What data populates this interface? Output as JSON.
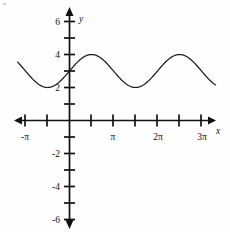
{
  "figure": {
    "name": "sine-curve-graph",
    "background_color": "#fefefe",
    "axis_color": "#111111",
    "curve_color": "#1b1b1b"
  },
  "axes": {
    "x_axis_label": "x",
    "y_axis_label": "y",
    "x_tick_labels": [
      "-π",
      "π",
      "2π",
      "3π"
    ],
    "y_tick_labels": [
      "6",
      "4",
      "2",
      "-2",
      "-4",
      "-6"
    ],
    "x_arrows": "both",
    "y_arrows": "both"
  },
  "chart_data": {
    "type": "line",
    "title": "",
    "xlabel": "x",
    "ylabel": "y",
    "grid": false,
    "legend": "none",
    "equation": "y = 3 + sin(x)",
    "midline": 3,
    "amplitude": 1,
    "period": "2π",
    "xlim": [
      "-1.25π",
      "3.4π"
    ],
    "ylim": [
      -7,
      7
    ],
    "x_tick_values": [
      "-π",
      "-π/2",
      "0",
      "π/2",
      "π",
      "3π/2",
      "2π",
      "5π/2",
      "3π"
    ],
    "x_labeled_ticks": [
      {
        "value": "-π",
        "label": "-π"
      },
      {
        "value": "π",
        "label": "π"
      },
      {
        "value": "2π",
        "label": "2π"
      },
      {
        "value": "3π",
        "label": "3π"
      }
    ],
    "y_tick_values": [
      -6,
      -5,
      -4,
      -3,
      -2,
      -1,
      1,
      2,
      3,
      4,
      5,
      6
    ],
    "y_labeled_ticks": [
      {
        "value": 6,
        "label": "6"
      },
      {
        "value": 4,
        "label": "4"
      },
      {
        "value": 2,
        "label": "2"
      },
      {
        "value": -2,
        "label": "-2"
      },
      {
        "value": -4,
        "label": "-4"
      },
      {
        "value": -6,
        "label": "-6"
      }
    ],
    "key_points": [
      {
        "x": "-π/2",
        "y": 2,
        "kind": "minimum"
      },
      {
        "x": "0",
        "y": 3,
        "kind": "midline-rising"
      },
      {
        "x": "π/2",
        "y": 4,
        "kind": "maximum"
      },
      {
        "x": "π",
        "y": 3,
        "kind": "midline-falling"
      },
      {
        "x": "3π/2",
        "y": 2,
        "kind": "minimum"
      },
      {
        "x": "2π",
        "y": 3,
        "kind": "midline-rising"
      },
      {
        "x": "5π/2",
        "y": 4,
        "kind": "maximum"
      },
      {
        "x": "3π",
        "y": 3,
        "kind": "midline-falling"
      }
    ],
    "series": [
      {
        "name": "y = 3 + sin(x)",
        "x": [
          "-1.15π",
          "-π",
          "-3π/4",
          "-π/2",
          "-π/4",
          "0",
          "π/4",
          "π/2",
          "3π/4",
          "π",
          "5π/4",
          "3π/2",
          "7π/4",
          "2π",
          "9π/4",
          "5π/2",
          "11π/4",
          "3π",
          "13π/4",
          "3.35π"
        ],
        "values": [
          3.45,
          3.0,
          2.29,
          2.0,
          2.29,
          3.0,
          3.71,
          4.0,
          3.71,
          3.0,
          2.29,
          2.0,
          2.29,
          3.0,
          3.71,
          4.0,
          3.71,
          3.0,
          2.29,
          2.11
        ]
      }
    ]
  }
}
